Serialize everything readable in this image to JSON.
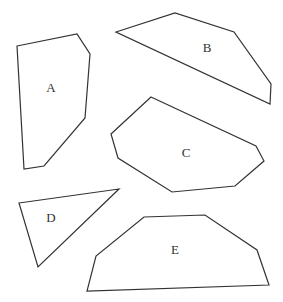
{
  "figure": {
    "width": 283,
    "height": 302,
    "background": "#ffffff",
    "stroke_color": "#333333",
    "shapes": [
      {
        "id": "A",
        "label": "A",
        "points": "17,46 77,34 90,54 85,118 44,166 24,169",
        "label_x": 51,
        "label_y": 89
      },
      {
        "id": "B",
        "label": "B",
        "points": "116,32 175,13 234,32 271,84 270,104",
        "label_x": 207,
        "label_y": 49
      },
      {
        "id": "C",
        "label": "C",
        "points": "151,97 256,146 264,161 235,186 172,192 118,158 111,134",
        "label_x": 186,
        "label_y": 154
      },
      {
        "id": "D",
        "label": "D",
        "points": "19,203 119,189 38,267",
        "label_x": 51,
        "label_y": 219
      },
      {
        "id": "E",
        "label": "E",
        "points": "144,217 205,215 257,250 269,285 87,291 96,256",
        "label_x": 175,
        "label_y": 251
      }
    ]
  }
}
